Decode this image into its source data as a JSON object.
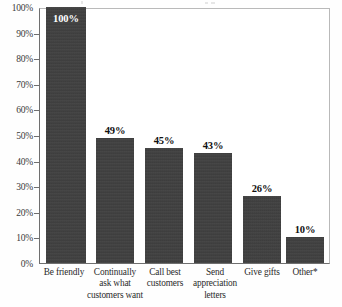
{
  "chart_data": {
    "type": "bar",
    "title": "",
    "subtitle": "",
    "xlabel": "",
    "ylabel": "",
    "ylim": [
      0,
      100
    ],
    "ytick_labels": [
      "100%",
      "90%",
      "80%",
      "70%",
      "60%",
      "50%",
      "40%",
      "30%",
      "20%",
      "10%",
      "0%"
    ],
    "ytick_values": [
      100,
      90,
      80,
      70,
      60,
      50,
      40,
      30,
      20,
      10,
      0
    ],
    "grid": false,
    "legend": false,
    "legend_position": "none",
    "bar_color": "#3f3f3f",
    "axis_color": "#6f6f6f",
    "categories": [
      "Be friendly",
      "Continually ask what customers want",
      "Call best customers",
      "Send appreciation letters",
      "Give gifts",
      "Other*"
    ],
    "category_lines": [
      [
        "Be friendly"
      ],
      [
        "Continually",
        "ask what",
        "customers want"
      ],
      [
        "Call best",
        "customers"
      ],
      [
        "Send",
        "appreciation",
        "letters"
      ],
      [
        "Give gifts"
      ],
      [
        "Other*"
      ]
    ],
    "values": [
      100,
      49,
      45,
      43,
      26,
      10
    ],
    "value_labels": [
      "100%",
      "49%",
      "45%",
      "43%",
      "26%",
      "10%"
    ],
    "label_placement": [
      "inside",
      "outside",
      "outside",
      "outside",
      "outside",
      "outside"
    ],
    "annotations": [
      "* asterisk denotes Other category footnote"
    ]
  }
}
